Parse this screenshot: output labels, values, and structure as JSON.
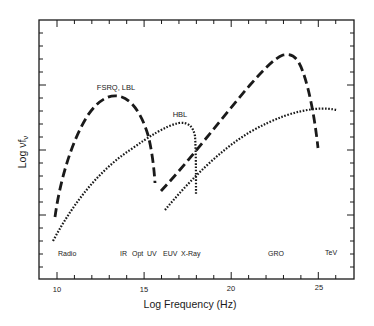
{
  "chart_data": {
    "type": "line",
    "title": "",
    "xlabel": "Log Frequency (Hz)",
    "ylabel": "Log νfν",
    "xlim": [
      9.2,
      27.0
    ],
    "xticks": [
      10,
      15,
      20,
      25
    ],
    "xtick_labels": [
      "10",
      "15",
      "20",
      "25"
    ],
    "yticks_labeled": false,
    "grid": false,
    "band_labels": [
      {
        "text": "Radio",
        "x": 10.8
      },
      {
        "text": "IR",
        "x": 14.0
      },
      {
        "text": "Opt",
        "x": 14.8
      },
      {
        "text": "UV",
        "x": 15.7
      },
      {
        "text": "EUV",
        "x": 16.8
      },
      {
        "text": "X-Ray",
        "x": 18.1
      },
      {
        "text": "GRO",
        "x": 22.6
      },
      {
        "text": "TeV",
        "x": 25.8
      }
    ],
    "series": [
      {
        "name": "FSRQ, LBL",
        "style": "dashed",
        "components": [
          {
            "label": "synchrotron",
            "x": [
              9.9,
              10.5,
              11.2,
              12.0,
              12.8,
              13.5,
              14.2,
              14.8,
              15.2,
              15.5
            ],
            "y_px": [
              217,
              178,
              140,
              113,
              99,
              96,
              105,
              128,
              160,
              183
            ]
          },
          {
            "label": "inverse-compton",
            "x": [
              16.0,
              17.0,
              18.0,
              19.0,
              20.0,
              21.0,
              22.0,
              22.8,
              23.5,
              24.0,
              24.6,
              25.0
            ],
            "y_px": [
              191,
              167,
              143,
              120,
              98,
              79,
              64,
              56,
              60,
              80,
              115,
              148
            ]
          }
        ]
      },
      {
        "name": "HBL",
        "style": "dotted",
        "components": [
          {
            "label": "synchrotron",
            "x": [
              9.8,
              11.0,
              12.5,
              14.0,
              15.5,
              16.5,
              17.2,
              17.7,
              17.9,
              17.95
            ],
            "y_px": [
              241,
              201,
              168,
              147,
              133,
              126,
              124,
              130,
              160,
              194
            ]
          },
          {
            "label": "inverse-compton",
            "x": [
              16.3,
              17.5,
              19.0,
              20.5,
              22.0,
              23.5,
              24.5,
              25.5,
              26.2
            ],
            "y_px": [
              209,
              186,
              161,
              140,
              124,
              114,
              110,
              109,
              110
            ]
          }
        ]
      }
    ],
    "annotations": [
      {
        "text": "FSRQ, LBL",
        "near_x": 13.5
      },
      {
        "text": "HBL",
        "near_x": 17.0
      }
    ]
  },
  "labels": {
    "xlabel": "Log Frequency (Hz)",
    "ylabel_main": "Log νf",
    "ylabel_sub": "ν",
    "series_fsrq": "FSRQ, LBL",
    "series_hbl": "HBL",
    "tick_10": "10",
    "tick_15": "15",
    "tick_20": "20",
    "tick_25": "25",
    "band_radio": "Radio",
    "band_ir": "IR",
    "band_opt": "Opt",
    "band_uv": "UV",
    "band_euv": "EUV",
    "band_xray": "X-Ray",
    "band_gro": "GRO",
    "band_tev": "TeV"
  },
  "colors": {
    "ink": "#1a1a1a",
    "background": "#ffffff"
  }
}
